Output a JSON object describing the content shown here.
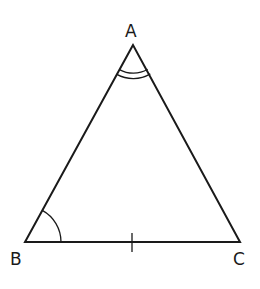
{
  "diagram": {
    "type": "triangle",
    "vertices": {
      "A": {
        "label": "A",
        "x": 133,
        "y": 45
      },
      "B": {
        "label": "B",
        "x": 25,
        "y": 242
      },
      "C": {
        "label": "C",
        "x": 240,
        "y": 242
      }
    },
    "markings": {
      "angle_A": "double arc",
      "angle_B": "single arc",
      "side_BC": "single tick mark"
    },
    "stroke_color": "#1a1a1a"
  }
}
